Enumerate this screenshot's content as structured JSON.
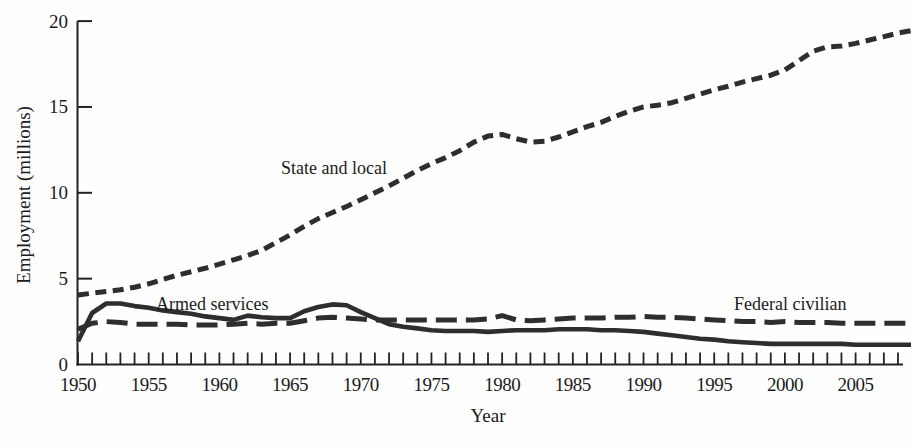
{
  "chart_data": {
    "type": "line",
    "title": "",
    "xlabel": "Year",
    "ylabel": "Employment (millions)",
    "line_color": "#2e2e2e",
    "axis_color": "#222222",
    "x": [
      1950,
      1951,
      1952,
      1953,
      1954,
      1955,
      1956,
      1957,
      1958,
      1959,
      1960,
      1961,
      1962,
      1963,
      1964,
      1965,
      1966,
      1967,
      1968,
      1969,
      1970,
      1971,
      1972,
      1973,
      1974,
      1975,
      1976,
      1977,
      1978,
      1979,
      1980,
      1981,
      1982,
      1983,
      1984,
      1985,
      1986,
      1987,
      1988,
      1989,
      1990,
      1991,
      1992,
      1993,
      1994,
      1995,
      1996,
      1997,
      1998,
      1999,
      2000,
      2001,
      2002,
      2003,
      2004,
      2005,
      2006,
      2007,
      2008,
      2009
    ],
    "series": [
      {
        "name": "State and local",
        "line_style": "short-dash",
        "values": [
          4.05,
          4.15,
          4.25,
          4.35,
          4.5,
          4.7,
          4.95,
          5.2,
          5.4,
          5.6,
          5.85,
          6.1,
          6.35,
          6.65,
          7.1,
          7.55,
          8.05,
          8.5,
          8.85,
          9.2,
          9.6,
          10.0,
          10.4,
          10.85,
          11.3,
          11.7,
          12.05,
          12.45,
          12.95,
          13.3,
          13.4,
          13.15,
          12.95,
          13.0,
          13.25,
          13.55,
          13.85,
          14.1,
          14.45,
          14.75,
          15.0,
          15.1,
          15.25,
          15.5,
          15.75,
          16.0,
          16.2,
          16.45,
          16.65,
          16.85,
          17.15,
          17.7,
          18.25,
          18.5,
          18.55,
          18.7,
          18.9,
          19.1,
          19.3,
          19.45
        ]
      },
      {
        "name": "Federal civilian",
        "line_style": "long-dash",
        "values": [
          2.05,
          2.4,
          2.5,
          2.45,
          2.35,
          2.35,
          2.35,
          2.35,
          2.3,
          2.3,
          2.3,
          2.35,
          2.4,
          2.35,
          2.4,
          2.4,
          2.55,
          2.7,
          2.75,
          2.7,
          2.65,
          2.6,
          2.6,
          2.6,
          2.6,
          2.6,
          2.6,
          2.6,
          2.6,
          2.65,
          2.85,
          2.6,
          2.55,
          2.6,
          2.65,
          2.7,
          2.7,
          2.7,
          2.75,
          2.75,
          2.8,
          2.75,
          2.75,
          2.7,
          2.65,
          2.6,
          2.55,
          2.5,
          2.5,
          2.45,
          2.5,
          2.45,
          2.45,
          2.45,
          2.4,
          2.4,
          2.4,
          2.4,
          2.4,
          2.4
        ]
      },
      {
        "name": "Armed services",
        "line_style": "solid",
        "values": [
          1.35,
          3.0,
          3.55,
          3.55,
          3.4,
          3.3,
          3.15,
          3.05,
          2.95,
          2.8,
          2.7,
          2.6,
          2.85,
          2.75,
          2.7,
          2.7,
          3.1,
          3.35,
          3.5,
          3.45,
          3.05,
          2.7,
          2.35,
          2.2,
          2.1,
          2.0,
          1.95,
          1.95,
          1.95,
          1.9,
          1.95,
          2.0,
          2.0,
          2.0,
          2.05,
          2.05,
          2.05,
          2.0,
          2.0,
          1.95,
          1.9,
          1.8,
          1.7,
          1.6,
          1.5,
          1.45,
          1.35,
          1.3,
          1.25,
          1.2,
          1.2,
          1.2,
          1.2,
          1.2,
          1.2,
          1.15,
          1.15,
          1.15,
          1.15,
          1.15
        ]
      }
    ],
    "annotations": [
      {
        "text": "State and local",
        "x_px": 281,
        "y_px": 174
      },
      {
        "text": "Armed services",
        "x_px": 156,
        "y_px": 310
      },
      {
        "text": "Federal civilian",
        "x_px": 734,
        "y_px": 310
      }
    ],
    "axes": {
      "xlim": [
        1950,
        2008
      ],
      "x_px": [
        78,
        898
      ],
      "ylim": [
        0,
        20
      ],
      "y_px": [
        364.5,
        21.1
      ],
      "x_tick_start": 1950,
      "x_tick_end": 2008,
      "x_tick_step": 1,
      "x_label_years": [
        1950,
        1955,
        1960,
        1965,
        1970,
        1975,
        1980,
        1985,
        1990,
        1995,
        2000,
        2005
      ],
      "y_ticks": [
        5,
        10,
        15,
        20
      ],
      "y_tick_labels": [
        0,
        5,
        10,
        15,
        20
      ],
      "grid": false,
      "legend": "inline-labels"
    }
  }
}
